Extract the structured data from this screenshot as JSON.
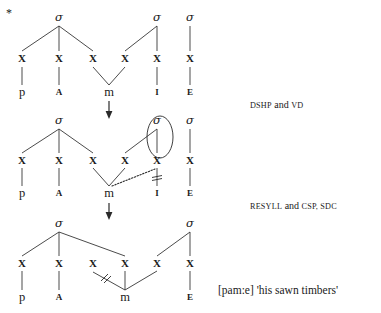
{
  "figure": {
    "star": "*",
    "gloss": "[pam:e] 'his sawn timbers'",
    "gloss_plain": "[pam:e] 'his sawn timbers'"
  },
  "rules": {
    "step1": "DSHP and VD",
    "step1_parts": {
      "a": "DSHP",
      "mid": " and ",
      "b": "VD"
    },
    "step2": "RESYLL and CSP, SDC",
    "step2_parts": {
      "a": "RESYLL",
      "mid": " and ",
      "b": "CSP, SDC"
    }
  },
  "labels": {
    "sigma": "σ",
    "x": "X",
    "arrow": "↓"
  },
  "trees": [
    {
      "name": "tree-input",
      "sigmas": [
        {
          "label": "σ",
          "x": 59,
          "y": 21
        },
        {
          "label": "σ",
          "x": 157,
          "y": 21
        },
        {
          "label": "σ",
          "x": 190,
          "y": 21
        }
      ],
      "skeleton": [
        {
          "label": "X",
          "x": 22,
          "y": 58
        },
        {
          "label": "X",
          "x": 59,
          "y": 58
        },
        {
          "label": "X",
          "x": 93,
          "y": 58
        },
        {
          "label": "X",
          "x": 125,
          "y": 58
        },
        {
          "label": "X",
          "x": 157,
          "y": 58
        },
        {
          "label": "X",
          "x": 190,
          "y": 58
        }
      ],
      "segments": [
        {
          "label": "p",
          "x": 22,
          "y": 92,
          "size": "big"
        },
        {
          "label": "A",
          "x": 59,
          "y": 92,
          "size": "small"
        },
        {
          "label": "m",
          "x": 109,
          "y": 92,
          "size": "big"
        },
        {
          "label": "I",
          "x": 157,
          "y": 92,
          "size": "small"
        },
        {
          "label": "E",
          "x": 190,
          "y": 92,
          "size": "small"
        }
      ]
    },
    {
      "name": "tree-middle",
      "sigmas": [
        {
          "label": "σ",
          "x": 59,
          "y": 124
        },
        {
          "label": "σ",
          "x": 157,
          "y": 124
        },
        {
          "label": "σ",
          "x": 190,
          "y": 124
        }
      ],
      "skeleton": [
        {
          "label": "X",
          "x": 22,
          "y": 160
        },
        {
          "label": "X",
          "x": 59,
          "y": 160
        },
        {
          "label": "X",
          "x": 93,
          "y": 160
        },
        {
          "label": "X",
          "x": 125,
          "y": 160
        },
        {
          "label": "X",
          "x": 157,
          "y": 160
        },
        {
          "label": "X",
          "x": 190,
          "y": 160
        }
      ],
      "segments": [
        {
          "label": "p",
          "x": 22,
          "y": 193,
          "size": "big"
        },
        {
          "label": "A",
          "x": 59,
          "y": 193,
          "size": "small"
        },
        {
          "label": "m",
          "x": 109,
          "y": 193,
          "size": "big"
        },
        {
          "label": "I",
          "x": 157,
          "y": 193,
          "size": "small"
        },
        {
          "label": "E",
          "x": 190,
          "y": 193,
          "size": "small"
        }
      ]
    },
    {
      "name": "tree-output",
      "sigmas": [
        {
          "label": "σ",
          "x": 59,
          "y": 227
        },
        {
          "label": "σ",
          "x": 190,
          "y": 227
        }
      ],
      "skeleton": [
        {
          "label": "X",
          "x": 22,
          "y": 263
        },
        {
          "label": "X",
          "x": 59,
          "y": 263
        },
        {
          "label": "X",
          "x": 93,
          "y": 263
        },
        {
          "label": "X",
          "x": 125,
          "y": 263
        },
        {
          "label": "X",
          "x": 157,
          "y": 263
        },
        {
          "label": "X",
          "x": 190,
          "y": 263
        }
      ],
      "segments": [
        {
          "label": "p",
          "x": 22,
          "y": 297,
          "size": "big"
        },
        {
          "label": "A",
          "x": 59,
          "y": 297,
          "size": "small"
        },
        {
          "label": "m",
          "x": 125,
          "y": 297,
          "size": "big"
        },
        {
          "label": "E",
          "x": 190,
          "y": 297,
          "size": "small"
        }
      ]
    }
  ],
  "colors": {
    "ink": "#1a1a1a",
    "line": "#2a2a2a",
    "background": "#ffffff"
  }
}
